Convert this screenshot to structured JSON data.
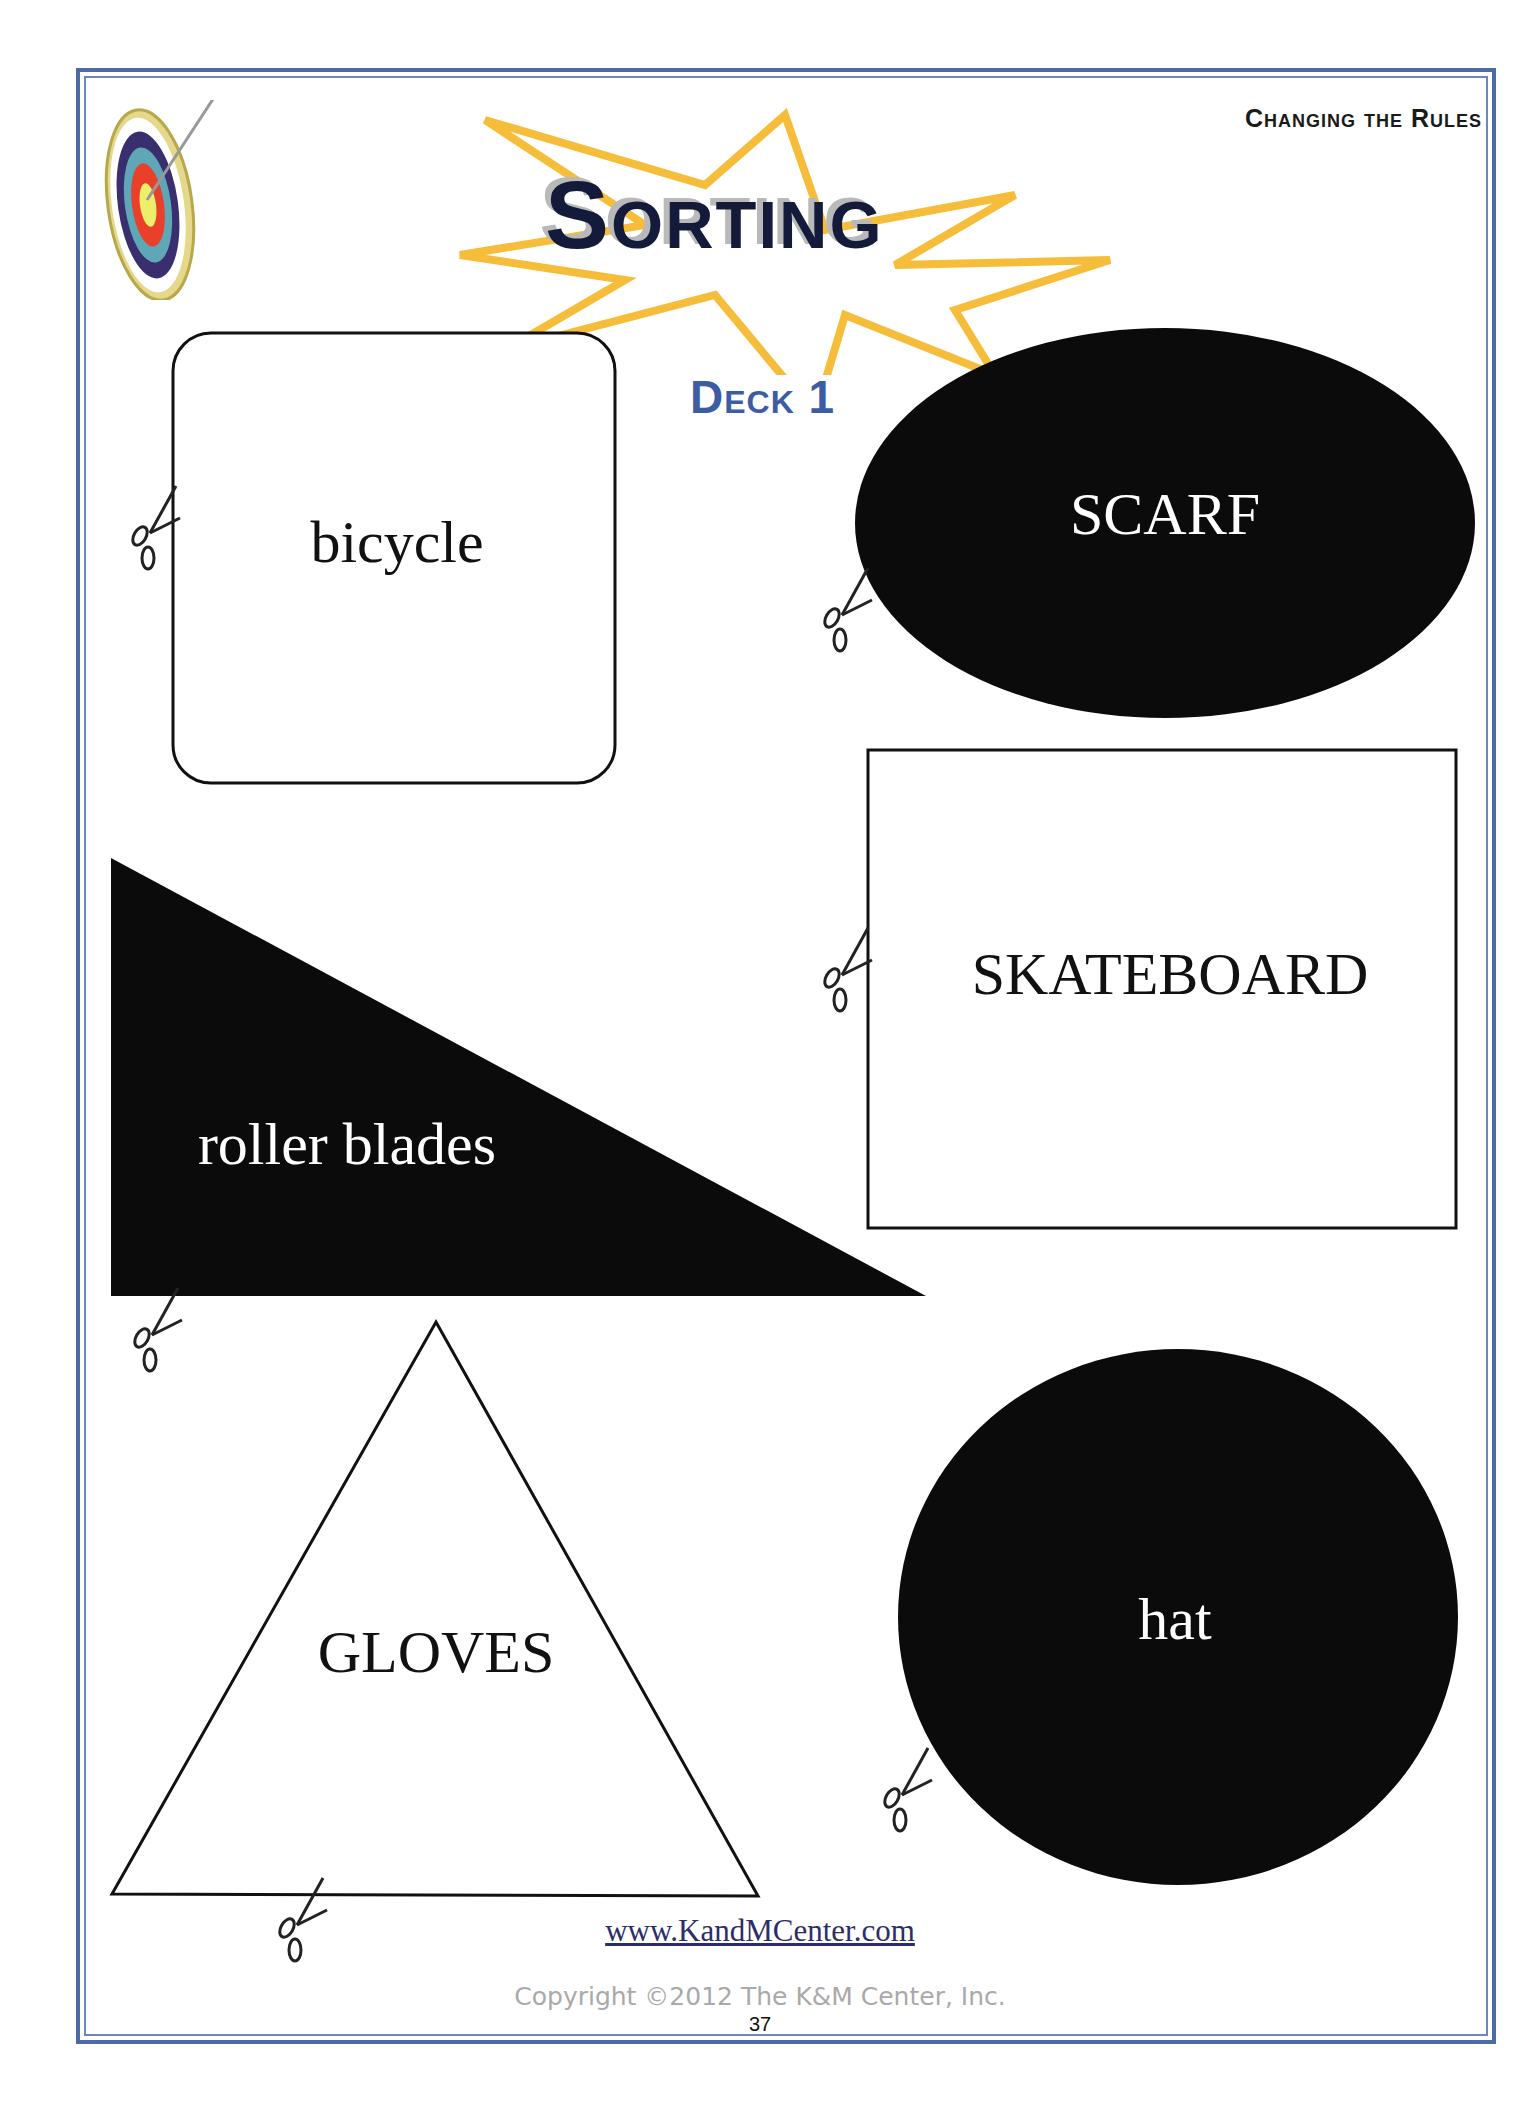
{
  "header": {
    "section": "Changing the Rules",
    "title": "Sorting",
    "subtitle": "Deck 1"
  },
  "cards": [
    {
      "label": "bicycle",
      "shape": "rounded-square",
      "fill": "white"
    },
    {
      "label": "SCARF",
      "shape": "oval",
      "fill": "black"
    },
    {
      "label": "roller blades",
      "shape": "right-triangle",
      "fill": "black"
    },
    {
      "label": "SKATEBOARD",
      "shape": "rectangle",
      "fill": "white"
    },
    {
      "label": "GLOVES",
      "shape": "triangle",
      "fill": "white"
    },
    {
      "label": "hat",
      "shape": "circle",
      "fill": "black"
    }
  ],
  "icons": {
    "logo": "target-with-arrow-icon",
    "cut": "scissors-icon"
  },
  "footer": {
    "website": "www.KandMCenter.com",
    "copyright": "Copyright ©2012 The K&M Center, Inc.",
    "page_number": "37"
  },
  "colors": {
    "frame": "#4a6aaa",
    "title": "#141a3a",
    "deck": "#3c5ca4",
    "starburst": "#f5bd3a"
  }
}
